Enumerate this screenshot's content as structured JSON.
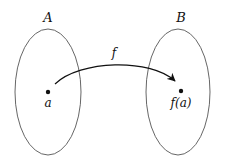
{
  "diagram": {
    "sets": [
      {
        "name": "A",
        "element": "a"
      },
      {
        "name": "B",
        "element": "f(a)"
      }
    ],
    "mapping": {
      "label": "f",
      "from": "a",
      "to": "f(a)"
    },
    "colors": {
      "stroke": "#555555",
      "ink": "#111111",
      "background": "#ffffff"
    }
  }
}
